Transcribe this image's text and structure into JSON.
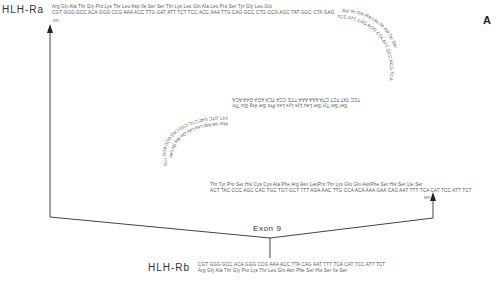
{
  "panel_label": "A",
  "exon_label": "Exon 9",
  "hlh_ra": {
    "label": "HLH-Ra",
    "aa_line": "Arg Gly Ala  Thr Gly Pro Lys Thr Leu Asp Ile Ser Ser Thr Lys Leu Gln Ala Leu Pro Ser Tyr Gly Leu Glu",
    "nt_line": "CGT GGG GCC ACA GGG CCG AAA ACC TTG GAT ATT TCT TCC ACC AAA TTG CAG GCC CTG CCG AGC TAT GGC CTA GAG",
    "start_pos": "691",
    "curve_upper_aa": "Ser Ile Gln Ala Leu Ile Ala Tyr",
    "curve_upper_nt": "TCC ATT CAG AGG CTA ATT GCC ACG TCA",
    "middle_aa": "Ser Ser Tyr Ser Leu  Lys Lys Leu Pro Ser Arg Glu Thr",
    "middle_nt": "TCC TAT  TCT CTA AAA AAA TTG CCA TCA AGA GAA ACA",
    "curve_lower_aa": "Phe Val Asp Leu Leu Gln Ala Thr Leu",
    "curve_lower_nt": "TTT GTC GAT CTC CTG CAG GCC ACG TTG",
    "lower_aa": "Thr Tyr Pro Ser His Cys Cys Ala  Phe Arg Asn LeuPro Thr  Lys Glu Gln AsnPhe Ser His Ser  Lle Ser",
    "lower_nt": "ACT TAC CCC AGC CAC TGC TGT GCT TTT AGA  AAC TTG CCA ACA AAA GAA CAG AAT TTT TCA  CAT TCC ATT  TCT",
    "end_pos": "889"
  },
  "hlh_rb": {
    "label": "HLH-Rb",
    "nt_line": "CGT GGG GCC ACA GGG CCG  AAA ACC  TTA  CAG  AAT  TTT  TCA  CAT TCC  ATT  TCT",
    "aa_line": "Arg  Gly  Ala Thr Gly  Pro  Lys Thr  Leu  Gln  Asn  Phe  Ser  His  Ser  Ile  Ser"
  }
}
